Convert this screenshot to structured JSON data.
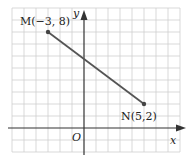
{
  "diagram": {
    "type": "coordinate-plane",
    "axes": {
      "x_label": "x",
      "y_label": "y",
      "origin_label": "O"
    },
    "grid": {
      "x_range": [
        -6,
        8
      ],
      "y_range": [
        -2,
        10
      ],
      "unit": 1
    },
    "points": [
      {
        "name": "M",
        "label": "M(−3, 8)",
        "x": -3,
        "y": 8
      },
      {
        "name": "N",
        "label": "N(5,2)",
        "x": 5,
        "y": 2
      }
    ],
    "segment": {
      "from": "M",
      "to": "N"
    },
    "colors": {
      "grid": "#cfcfcf",
      "axis": "#333333",
      "segment": "#555555"
    }
  }
}
